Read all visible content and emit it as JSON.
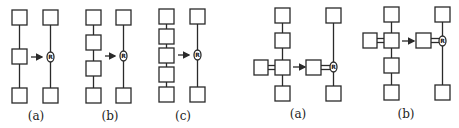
{
  "figure": {
    "left_group": {
      "panels": [
        {
          "label": "(a)",
          "chain_boxes": 3,
          "node_label": "R"
        },
        {
          "label": "(b)",
          "chain_boxes": 4,
          "node_label": "R"
        },
        {
          "label": "(c)",
          "chain_boxes": 5,
          "node_label": "R"
        }
      ]
    },
    "right_group": {
      "panels": [
        {
          "label": "(a)",
          "chain_boxes": 4,
          "branch": "double-bond side box",
          "node_label": "R"
        },
        {
          "label": "(b)",
          "chain_boxes": 4,
          "branch": "double-bond side box",
          "node_label": "R"
        }
      ]
    },
    "colors": {
      "stroke": "#2a2a2a",
      "background": "#ffffff"
    }
  }
}
